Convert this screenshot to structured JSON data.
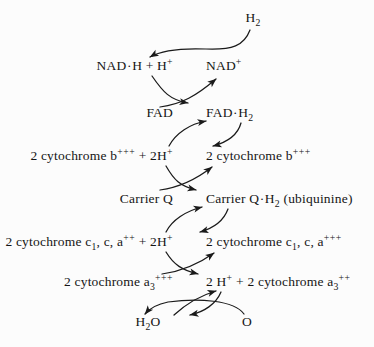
{
  "diagram": {
    "background_color": "#fcfcfc",
    "line_color": "#1a1a1a",
    "text_color": "#151515"
  },
  "labels": {
    "h2": {
      "base": "H",
      "sub": "2"
    },
    "nadh": {
      "text": "NAD·H + H",
      "sup": "+"
    },
    "nad_plus": {
      "text": "NAD",
      "sup": "+"
    },
    "fad": {
      "text": "FAD"
    },
    "fad_h2": {
      "text": "FAD·H",
      "sub": "2"
    },
    "cyt_b_left": {
      "pre": "2 cytochrome b",
      "sup1": "+++",
      "mid": " + 2H",
      "sup2": "+"
    },
    "cyt_b_right": {
      "pre": "2 cytochrome b",
      "sup": "+++"
    },
    "carrier_q": {
      "text": "Carrier Q"
    },
    "carrier_q_h2": {
      "pre": "Carrier Q·H",
      "sub": "2",
      "post": " (ubiquinine)"
    },
    "cyt_c1_left": {
      "pre": "2 cytochrome c",
      "sub": "1",
      "mid1": ", c, a",
      "sup1": "++",
      "mid2": " + 2H",
      "sup2": "+"
    },
    "cyt_c1_right": {
      "pre": "2 cytochrome c",
      "sub": "1",
      "mid": ", c, a",
      "sup": "+++"
    },
    "cyt_a3_left": {
      "pre": "2 cytochrome a",
      "sub": "3",
      "sup": "+++"
    },
    "cyt_a3_right": {
      "pre": "2 H",
      "sup1": "+",
      "mid": " + 2 cytochrome a",
      "sub": "3",
      "sup2": "++"
    },
    "h2o": {
      "base": "H",
      "sub": "2",
      "post": "O"
    },
    "oxygen": {
      "text": "O"
    }
  },
  "rows": [
    {
      "name": "h2-row",
      "y": 18,
      "left": null,
      "right": null,
      "center": "h2"
    },
    {
      "name": "nad-row",
      "y": 66,
      "left": "nadh",
      "right": "nad_plus"
    },
    {
      "name": "fad-row",
      "y": 113,
      "left": "fad",
      "right": "fad_h2"
    },
    {
      "name": "cyt-b-row",
      "y": 156,
      "left": "cyt_b_left",
      "right": "cyt_b_right"
    },
    {
      "name": "carrier-row",
      "y": 199,
      "left": "carrier_q",
      "right": "carrier_q_h2"
    },
    {
      "name": "cyt-c1-row",
      "y": 242,
      "left": "cyt_c1_left",
      "right": "cyt_c1_right"
    },
    {
      "name": "cyt-a3-row",
      "y": 282,
      "left": "cyt_a3_left",
      "right": "cyt_a3_right"
    },
    {
      "name": "water-row",
      "y": 322,
      "left": "h2o",
      "right": "oxygen"
    }
  ],
  "geometry": {
    "left_anchor_x": 173,
    "right_anchor_x": 206,
    "center_x": 189,
    "h2_center_x": 253
  }
}
